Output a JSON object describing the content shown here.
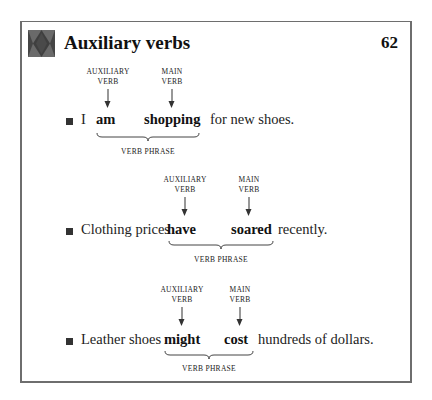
{
  "header": {
    "title": "Auxiliary verbs",
    "page_number": "62",
    "icon": "diamond-pattern-icon"
  },
  "labels": {
    "auxiliary_line1": "AUXILIARY",
    "auxiliary_line2": "VERB",
    "main_line1": "MAIN",
    "main_line2": "VERB",
    "verb_phrase": "VERB PHRASE"
  },
  "examples": [
    {
      "subject": "I",
      "auxiliary": "am",
      "main": "shopping",
      "rest": "for new shoes."
    },
    {
      "subject": "Clothing prices",
      "auxiliary": "have",
      "main": "soared",
      "rest": "recently."
    },
    {
      "subject": "Leather shoes",
      "auxiliary": "might",
      "main": "cost",
      "rest": "hundreds of dollars."
    }
  ]
}
